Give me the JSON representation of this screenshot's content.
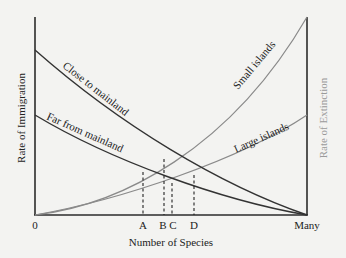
{
  "diagram": {
    "x_axis": {
      "label": "Number of Species",
      "start_label": "0",
      "end_label": "Many"
    },
    "y_axis_left": {
      "label": "Rate of Immigration"
    },
    "y_axis_right": {
      "label": "Rate of Extinction"
    },
    "curves": {
      "close": "Close to mainland",
      "far": "Far from mainland",
      "small": "Small islands",
      "large": "Large islands"
    },
    "equilibria": [
      "A",
      "B",
      "C",
      "D"
    ],
    "colors": {
      "immigration_curves": "#333333",
      "extinction_curves": "#8a8a8a",
      "background": "#f3f3f1"
    }
  }
}
